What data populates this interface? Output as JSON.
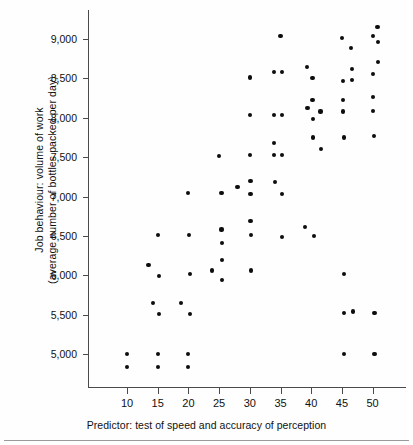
{
  "axes": {
    "ylabel_line1": "Job behaviour: volume of work",
    "ylabel_line2": "(average number of bottles packed per day)",
    "xlabel": "Predictor: test of speed and accuracy of perception",
    "yticks": [
      "5,000",
      "5,500",
      "6,000",
      "6,500",
      "7,000",
      "7,500",
      "8,000",
      "8,500",
      "9,000"
    ],
    "xticks": [
      "10",
      "15",
      "20",
      "25",
      "30",
      "35",
      "40",
      "45",
      "50"
    ],
    "marker_color": "#0d0d0d",
    "axis_color": "#4b4b4b"
  },
  "chart_data": {
    "type": "scatter",
    "title": "",
    "xlabel": "Predictor: test of speed and accuracy of perception",
    "ylabel": "Job behaviour: volume of work (average number of bottles packed per day)",
    "xlim": [
      7,
      55
    ],
    "ylim": [
      4650,
      9250
    ],
    "xticks": [
      10,
      15,
      20,
      25,
      30,
      35,
      40,
      45,
      50
    ],
    "yticks": [
      5000,
      5500,
      6000,
      6500,
      7000,
      7500,
      8000,
      8500,
      9000
    ],
    "grid": false,
    "legend": null,
    "points": [
      [
        10.0,
        5000
      ],
      [
        10.0,
        4840
      ],
      [
        13.5,
        6130
      ],
      [
        14.2,
        5650
      ],
      [
        15.0,
        5000
      ],
      [
        15.0,
        4840
      ],
      [
        15.0,
        6510
      ],
      [
        15.2,
        5990
      ],
      [
        15.2,
        5510
      ],
      [
        18.8,
        5650
      ],
      [
        20.0,
        5000
      ],
      [
        20.0,
        4840
      ],
      [
        20.0,
        7040
      ],
      [
        20.1,
        6510
      ],
      [
        20.2,
        6020
      ],
      [
        20.2,
        5510
      ],
      [
        23.9,
        6060
      ],
      [
        25.0,
        7510
      ],
      [
        25.4,
        7040
      ],
      [
        25.4,
        6580
      ],
      [
        25.5,
        6410
      ],
      [
        25.5,
        6190
      ],
      [
        25.5,
        5940
      ],
      [
        28.0,
        7120
      ],
      [
        30.0,
        8510
      ],
      [
        30.0,
        8030
      ],
      [
        30.0,
        7530
      ],
      [
        30.1,
        7200
      ],
      [
        30.1,
        7030
      ],
      [
        30.1,
        6690
      ],
      [
        30.2,
        6510
      ],
      [
        30.2,
        6060
      ],
      [
        33.9,
        8580
      ],
      [
        33.9,
        8040
      ],
      [
        34.0,
        7680
      ],
      [
        34.0,
        7530
      ],
      [
        34.1,
        7180
      ],
      [
        35.0,
        9040
      ],
      [
        35.2,
        8580
      ],
      [
        35.2,
        8040
      ],
      [
        35.3,
        7530
      ],
      [
        35.3,
        7030
      ],
      [
        35.3,
        6490
      ],
      [
        39.0,
        6610
      ],
      [
        39.3,
        8640
      ],
      [
        39.4,
        8120
      ],
      [
        40.2,
        8500
      ],
      [
        40.2,
        8230
      ],
      [
        40.3,
        7980
      ],
      [
        40.3,
        7750
      ],
      [
        40.4,
        6500
      ],
      [
        41.5,
        8080
      ],
      [
        41.6,
        7600
      ],
      [
        45.0,
        9010
      ],
      [
        45.2,
        8470
      ],
      [
        45.2,
        8230
      ],
      [
        45.2,
        8080
      ],
      [
        45.3,
        7750
      ],
      [
        45.3,
        6020
      ],
      [
        45.3,
        5520
      ],
      [
        45.4,
        5000
      ],
      [
        46.5,
        8890
      ],
      [
        46.6,
        8620
      ],
      [
        46.6,
        8480
      ],
      [
        46.8,
        5540
      ],
      [
        50.0,
        9040
      ],
      [
        50.1,
        8560
      ],
      [
        50.1,
        8260
      ],
      [
        50.1,
        8090
      ],
      [
        50.2,
        7770
      ],
      [
        50.3,
        5520
      ],
      [
        50.3,
        5000
      ],
      [
        50.8,
        9150
      ],
      [
        50.9,
        8960
      ],
      [
        50.9,
        8710
      ]
    ]
  }
}
